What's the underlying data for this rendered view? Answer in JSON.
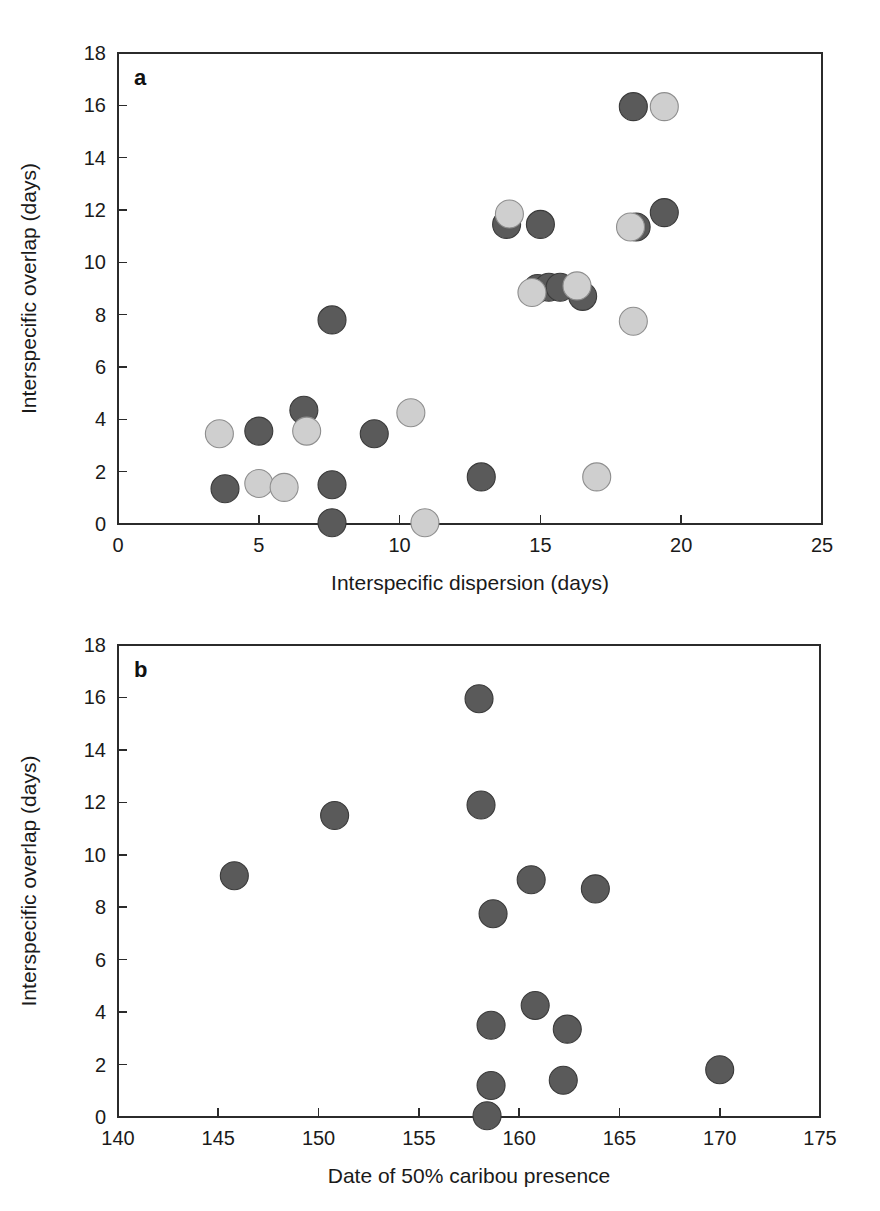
{
  "figure": {
    "panels": [
      {
        "id": "a",
        "letter": "a"
      },
      {
        "id": "b",
        "letter": "b"
      }
    ]
  },
  "chart_data": [
    {
      "type": "scatter",
      "panel": "a",
      "title": "",
      "xlabel": "Interspecific dispersion (days)",
      "ylabel": "Interspecific overlap (days)",
      "xlim": [
        0,
        25
      ],
      "ylim": [
        0,
        18
      ],
      "xticks": [
        0,
        5,
        10,
        15,
        20,
        25
      ],
      "yticks": [
        0,
        2,
        4,
        6,
        8,
        10,
        12,
        14,
        16,
        18
      ],
      "xticklabels": [
        "0",
        "5",
        "10",
        "15",
        "20",
        "25"
      ],
      "yticklabels": [
        "0",
        "2",
        "4",
        "6",
        "8",
        "10",
        "12",
        "14",
        "16",
        "18"
      ],
      "grid": false,
      "legend": "none",
      "series": [
        {
          "name": "dark",
          "color": "#5a5a5a",
          "points": [
            [
              3.8,
              1.35
            ],
            [
              5.0,
              3.55
            ],
            [
              6.6,
              4.35
            ],
            [
              7.6,
              7.8
            ],
            [
              7.6,
              1.5
            ],
            [
              7.6,
              0.05
            ],
            [
              9.1,
              3.45
            ],
            [
              12.9,
              1.8
            ],
            [
              13.8,
              11.45
            ],
            [
              15.0,
              11.45
            ],
            [
              14.9,
              9.0
            ],
            [
              15.3,
              9.05
            ],
            [
              15.7,
              9.05
            ],
            [
              16.5,
              8.7
            ],
            [
              18.3,
              15.95
            ],
            [
              18.4,
              11.35
            ],
            [
              19.4,
              11.9
            ]
          ]
        },
        {
          "name": "light",
          "color": "#cfcfcf",
          "points": [
            [
              3.6,
              3.45
            ],
            [
              5.0,
              1.55
            ],
            [
              5.9,
              1.4
            ],
            [
              6.7,
              3.55
            ],
            [
              10.4,
              4.25
            ],
            [
              10.9,
              0.05
            ],
            [
              13.9,
              11.85
            ],
            [
              14.7,
              8.85
            ],
            [
              16.3,
              9.1
            ],
            [
              17.0,
              1.8
            ],
            [
              18.2,
              11.35
            ],
            [
              18.3,
              7.75
            ],
            [
              19.4,
              15.95
            ]
          ]
        }
      ]
    },
    {
      "type": "scatter",
      "panel": "b",
      "title": "",
      "xlabel": "Date of 50% caribou presence",
      "ylabel": "Interspecific overlap (days)",
      "xlim": [
        140,
        175
      ],
      "ylim": [
        0,
        18
      ],
      "xticks": [
        140,
        145,
        150,
        155,
        160,
        165,
        170,
        175
      ],
      "yticks": [
        0,
        2,
        4,
        6,
        8,
        10,
        12,
        14,
        16,
        18
      ],
      "xticklabels": [
        "140",
        "145",
        "150",
        "155",
        "160",
        "165",
        "170",
        "175"
      ],
      "yticklabels": [
        "0",
        "2",
        "4",
        "6",
        "8",
        "10",
        "12",
        "14",
        "16",
        "18"
      ],
      "grid": false,
      "legend": "none",
      "series": [
        {
          "name": "dark",
          "color": "#5a5a5a",
          "points": [
            [
              145.8,
              9.2
            ],
            [
              150.8,
              11.5
            ],
            [
              158.0,
              15.95
            ],
            [
              158.1,
              11.9
            ],
            [
              158.7,
              7.75
            ],
            [
              160.6,
              9.05
            ],
            [
              163.8,
              8.7
            ],
            [
              160.8,
              4.25
            ],
            [
              158.6,
              3.5
            ],
            [
              162.4,
              3.35
            ],
            [
              158.6,
              1.2
            ],
            [
              162.2,
              1.4
            ],
            [
              170.0,
              1.8
            ],
            [
              158.4,
              0.05
            ]
          ]
        }
      ]
    }
  ]
}
